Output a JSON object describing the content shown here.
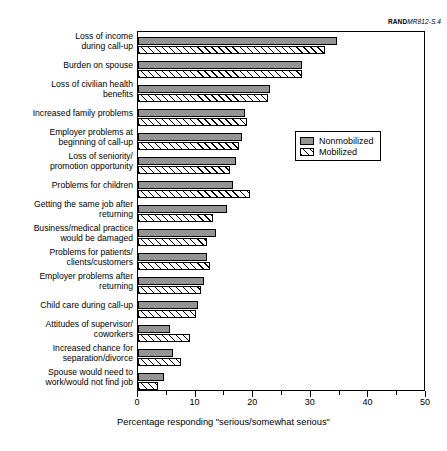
{
  "figure_id": {
    "prefix": "RAND",
    "suffix": "MR812-S.4"
  },
  "legend": {
    "position": "inside-right-upper",
    "entries": [
      {
        "label": "Nonmobilized",
        "swatch": "solid-gray",
        "color": "#949494"
      },
      {
        "label": "Mobilized",
        "swatch": "diagonal-hatch",
        "color": "#ffffff"
      }
    ]
  },
  "chart_data": {
    "type": "bar",
    "orientation": "horizontal",
    "title": "",
    "xlabel": "Percentage responding \"serious/somewhat serious\"",
    "ylabel": "",
    "xlim": [
      0,
      50
    ],
    "xticks": [
      0,
      10,
      20,
      30,
      40,
      50
    ],
    "xticks_minor": [
      5,
      15,
      25,
      35,
      45
    ],
    "grid": false,
    "legend_position": "upper right inside",
    "categories": [
      "Loss of income\nduring call-up",
      "Burden on spouse",
      "Loss of civilian health\nbenefits",
      "Increased family problems",
      "Employer problems at\nbeginning of call-up",
      "Loss of seniority/\npromotion opportunity",
      "Problems for children",
      "Getting the same job after\nreturning",
      "Business/medical practice\nwould be damaged",
      "Problems for patients/\nclients/customers",
      "Employer problems after\nreturning",
      "Child care during call-up",
      "Attitudes of supervisor/\ncoworkers",
      "Increased chance for\nseparation/divorce",
      "Spouse would need to\nwork/would not find job"
    ],
    "category_lines": [
      [
        "Loss of income",
        "during call-up"
      ],
      [
        "Burden on spouse"
      ],
      [
        "Loss of civilian health",
        "benefits"
      ],
      [
        "Increased family problems"
      ],
      [
        "Employer problems at",
        "beginning of call-up"
      ],
      [
        "Loss of seniority/",
        "promotion opportunity"
      ],
      [
        "Problems for children"
      ],
      [
        "Getting the same job after",
        "returning"
      ],
      [
        "Business/medical practice",
        "would be damaged"
      ],
      [
        "Problems for patients/",
        "clients/customers"
      ],
      [
        "Employer problems after",
        "returning"
      ],
      [
        "Child care during call-up"
      ],
      [
        "Attitudes of supervisor/",
        "coworkers"
      ],
      [
        "Increased chance for",
        "separation/divorce"
      ],
      [
        "Spouse would need to",
        "work/would not find job"
      ]
    ],
    "series": [
      {
        "name": "Nonmobilized",
        "values": [
          34.5,
          28.5,
          23.0,
          18.5,
          18.0,
          17.0,
          16.5,
          15.5,
          13.5,
          12.0,
          11.5,
          10.5,
          5.5,
          6.0,
          4.5
        ]
      },
      {
        "name": "Mobilized",
        "values": [
          32.5,
          28.5,
          22.5,
          19.0,
          17.5,
          16.0,
          19.5,
          13.0,
          12.0,
          12.5,
          11.0,
          10.0,
          9.0,
          7.5,
          3.5
        ]
      }
    ]
  }
}
